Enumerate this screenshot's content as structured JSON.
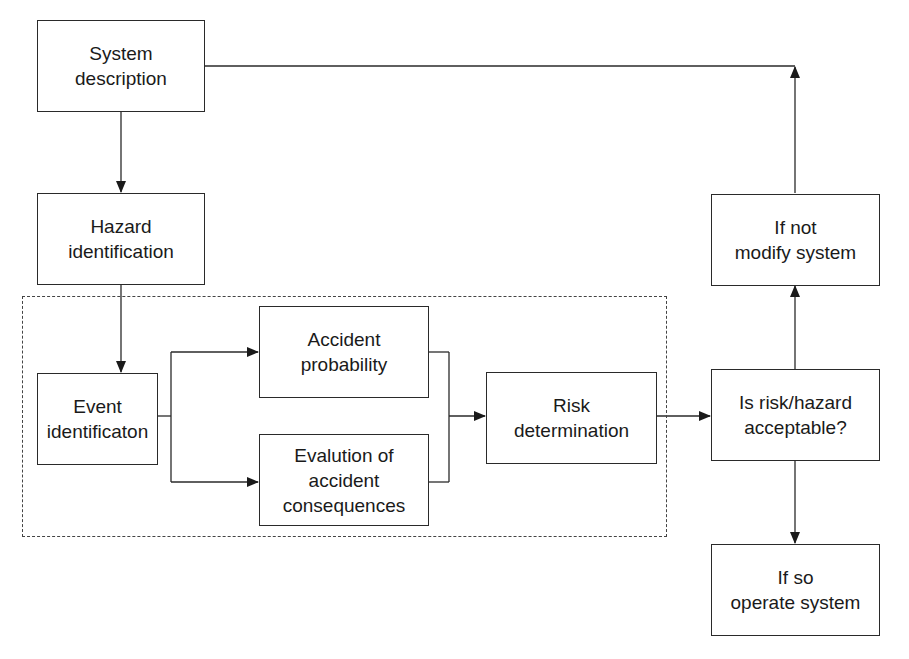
{
  "diagram": {
    "type": "flowchart",
    "nodes": {
      "system_description": {
        "line1": "System",
        "line2": "description"
      },
      "hazard_identification": {
        "line1": "Hazard",
        "line2": "identification"
      },
      "event_identification": {
        "line1": "Event",
        "line2": "identificaton"
      },
      "accident_probability": {
        "line1": "Accident",
        "line2": "probability"
      },
      "evaluation_consequences": {
        "line1": "Evalution of",
        "line2": "accident",
        "line3": "consequences"
      },
      "risk_determination": {
        "line1": "Risk",
        "line2": "determination"
      },
      "risk_acceptable": {
        "line1": "Is risk/hazard",
        "line2": "acceptable?"
      },
      "modify_system": {
        "line1": "If not",
        "line2": "modify system"
      },
      "operate_system": {
        "line1": "If so",
        "line2": "operate system"
      }
    },
    "edges": [
      {
        "from": "system_description",
        "to": "hazard_identification"
      },
      {
        "from": "hazard_identification",
        "to": "event_identification"
      },
      {
        "from": "event_identification",
        "to": "accident_probability"
      },
      {
        "from": "event_identification",
        "to": "evaluation_consequences"
      },
      {
        "from": "accident_probability",
        "to": "risk_determination"
      },
      {
        "from": "evaluation_consequences",
        "to": "risk_determination"
      },
      {
        "from": "risk_determination",
        "to": "risk_acceptable"
      },
      {
        "from": "risk_acceptable",
        "to": "modify_system"
      },
      {
        "from": "risk_acceptable",
        "to": "operate_system"
      },
      {
        "from": "modify_system",
        "to": "system_description"
      }
    ],
    "groups": [
      {
        "name": "dashed-analysis-region",
        "members": [
          "event_identification",
          "accident_probability",
          "evaluation_consequences",
          "risk_determination"
        ]
      }
    ]
  }
}
